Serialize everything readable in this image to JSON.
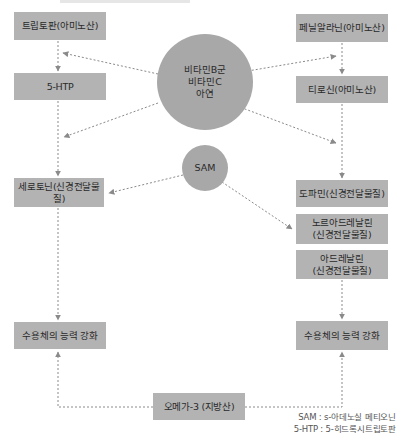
{
  "diagram": {
    "left_column": {
      "tryptophan": "트립토판(아미노산)",
      "htp": "5-HTP",
      "serotonin": "세로토닌(신경전달물질)",
      "receptor": "수용체의 능력 강화"
    },
    "right_column": {
      "phenylalanine": "페닐알라닌(아미노산)",
      "tyrosine": "티로신(아미노산)",
      "dopamine": "도파민(신경전달물질)",
      "noradrenaline_line1": "노르아드레날린",
      "noradrenaline_line2": "(신경전달물질)",
      "adrenaline_line1": "아드레날린",
      "adrenaline_line2": "(신경전달물질)",
      "receptor": "수용체의 능력 강화"
    },
    "cofactors": {
      "line1": "비타민B군",
      "line2": "비타민C",
      "line3": "아연"
    },
    "sam": "SAM",
    "omega": "오메가-3 (지방산)",
    "legend": {
      "sam": "SAM : s-아데노실 메티오닌",
      "htp": "5-HTP : 5-히드록시트립토판"
    },
    "colors": {
      "box_fill": "#b3b3b3",
      "circle_fill": "#a8a8a8",
      "arrow": "#8a8a8a"
    }
  }
}
